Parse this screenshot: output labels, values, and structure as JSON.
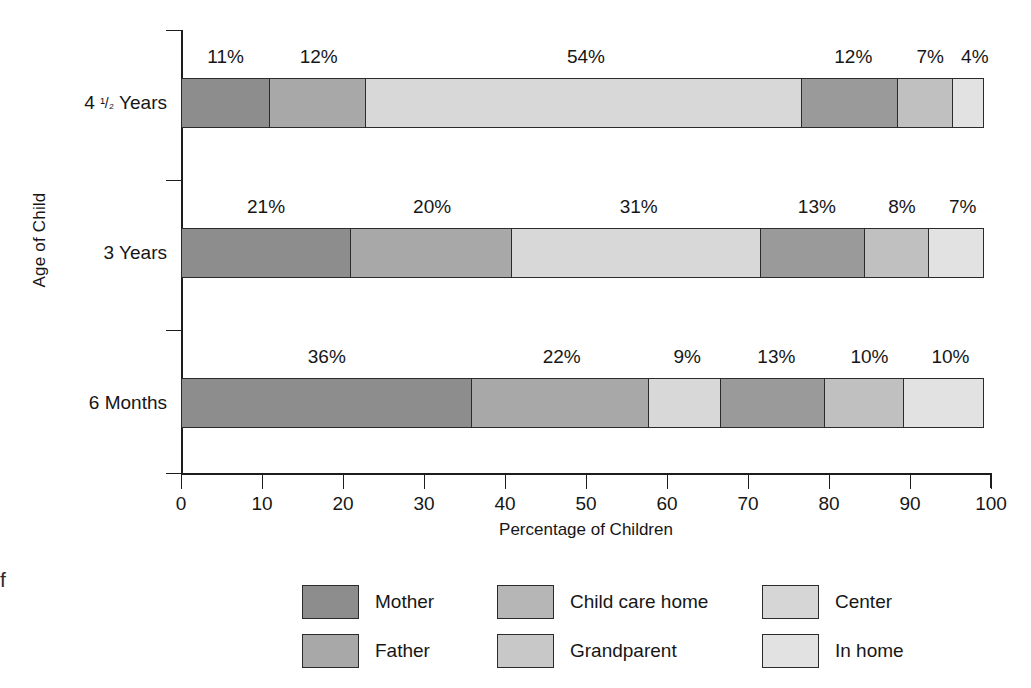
{
  "edge_fragment": "f",
  "chart_data": {
    "type": "bar",
    "orientation": "horizontal",
    "stacked": true,
    "normalized_percent": true,
    "title": "",
    "xlabel": "Percentage of Children",
    "ylabel": "Age of Child",
    "xlim": [
      0,
      100
    ],
    "xticks": [
      0,
      10,
      20,
      30,
      40,
      50,
      60,
      70,
      80,
      90,
      100
    ],
    "xtick_labels": [
      "0",
      "10",
      "20",
      "30",
      "40",
      "50",
      "60",
      "70",
      "80",
      "90",
      "100"
    ],
    "grid": false,
    "legend_position": "bottom",
    "categories": [
      "4 ½ Years",
      "3 Years",
      "6 Months"
    ],
    "category_labels": [
      {
        "lead": "4",
        "fraction": "¹/₂",
        "trail": "Years",
        "full": "4 ½ Years"
      },
      {
        "lead": "",
        "fraction": "",
        "trail": "3 Years",
        "full": "3 Years"
      },
      {
        "lead": "",
        "fraction": "",
        "trail": "6 Months",
        "full": "6 Months"
      }
    ],
    "series": [
      {
        "name": "Mother",
        "color": "#8d8d8d",
        "values": [
          11,
          21,
          36
        ]
      },
      {
        "name": "Father",
        "color": "#a8a8a8",
        "values": [
          12,
          20,
          22
        ]
      },
      {
        "name": "Child care home",
        "color": "#d8d8d8",
        "values": [
          54,
          31,
          9
        ]
      },
      {
        "name": "Grandparent",
        "color": "#9a9a9a",
        "values": [
          12,
          13,
          13
        ]
      },
      {
        "name": "Center",
        "color": "#c0c0c0",
        "values": [
          7,
          8,
          10
        ]
      },
      {
        "name": "In home",
        "color": "#e2e2e2",
        "values": [
          4,
          7,
          10
        ]
      }
    ],
    "bar_labels": [
      [
        "11%",
        "12%",
        "54%",
        "12%",
        "7%",
        "4%"
      ],
      [
        "21%",
        "20%",
        "31%",
        "13%",
        "8%",
        "7%"
      ],
      [
        "36%",
        "22%",
        "9%",
        "13%",
        "10%",
        "10%"
      ]
    ]
  },
  "legend": {
    "columns": [
      [
        {
          "label": "Mother",
          "color": "#8d8d8d"
        },
        {
          "label": "Father",
          "color": "#a8a8a8"
        }
      ],
      [
        {
          "label": "Child care home",
          "color": "#b6b6b6"
        },
        {
          "label": "Grandparent",
          "color": "#c8c8c8"
        }
      ],
      [
        {
          "label": "Center",
          "color": "#d6d6d6"
        },
        {
          "label": "In home",
          "color": "#e2e2e2"
        }
      ]
    ]
  }
}
